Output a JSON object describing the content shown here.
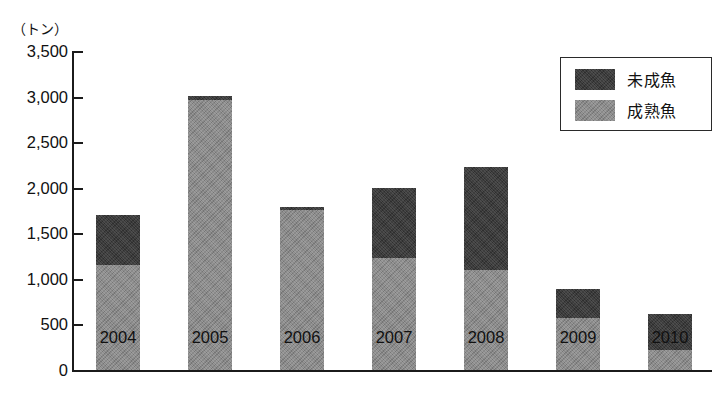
{
  "chart_data": {
    "type": "bar",
    "subtype": "stacked-vertical",
    "title": "",
    "xlabel": "",
    "ylabel": "（トン）",
    "y_unit_caption": "（トン）",
    "categories": [
      "2004",
      "2005",
      "2006",
      "2007",
      "2008",
      "2009",
      "2010"
    ],
    "series": [
      {
        "name": "成熟魚",
        "color": "#8b8b8b",
        "stack_order": 0,
        "values": [
          1150,
          2960,
          1760,
          1230,
          1100,
          570,
          220
        ]
      },
      {
        "name": "未成魚",
        "color": "#3b3b3b",
        "stack_order": 1,
        "values": [
          550,
          40,
          30,
          770,
          1125,
          320,
          395
        ]
      }
    ],
    "totals": [
      1700,
      3000,
      1790,
      2000,
      2225,
      890,
      615
    ],
    "ylim": [
      0,
      3500
    ],
    "y_ticks": [
      0,
      500,
      1000,
      1500,
      2000,
      2500,
      3000,
      3500
    ],
    "y_tick_labels": [
      "0",
      "500",
      "1,000",
      "1,500",
      "2,000",
      "2,500",
      "3,000",
      "3,500"
    ],
    "grid": false,
    "legend_position": "top-right",
    "legend_entries": [
      {
        "label": "未成魚",
        "color": "#3b3b3b"
      },
      {
        "label": "成熟魚",
        "color": "#8b8b8b"
      }
    ]
  },
  "colors": {
    "immature": "#3b3b3b",
    "mature": "#8b8b8b",
    "axis": "#1b1b1b",
    "background": "#ffffff"
  }
}
